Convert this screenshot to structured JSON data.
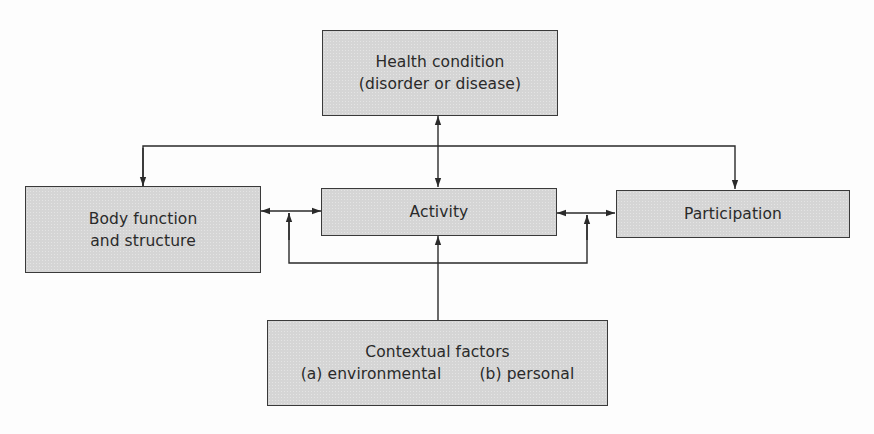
{
  "diagram": {
    "type": "flow-model",
    "nodes": {
      "health_condition": {
        "line1": "Health condition",
        "line2": "(disorder or disease)"
      },
      "body_function": {
        "line1": "Body function",
        "line2": "and structure"
      },
      "activity": {
        "label": "Activity"
      },
      "participation": {
        "label": "Participation"
      },
      "contextual_factors": {
        "line1": "Contextual factors",
        "option_a": "(a) environmental",
        "option_b": "(b) personal"
      }
    },
    "edges": [
      {
        "from": "health_condition",
        "to": "activity",
        "direction": "bidirectional"
      },
      {
        "from": "health_condition",
        "to": "body_function",
        "direction": "forward"
      },
      {
        "from": "health_condition",
        "to": "participation",
        "direction": "forward"
      },
      {
        "from": "body_function",
        "to": "activity",
        "direction": "bidirectional"
      },
      {
        "from": "activity",
        "to": "participation",
        "direction": "bidirectional"
      },
      {
        "from": "contextual_factors",
        "to": "activity",
        "direction": "forward"
      },
      {
        "from": "contextual_factors",
        "to": "body_function-activity link",
        "direction": "forward"
      },
      {
        "from": "contextual_factors",
        "to": "activity-participation link",
        "direction": "forward"
      }
    ],
    "colors": {
      "box_fill": "#d5d5d5",
      "box_border": "#3a3a3a",
      "line": "#2a2a2a",
      "text": "#2a2a2a",
      "background": "#fdfdfd"
    }
  }
}
